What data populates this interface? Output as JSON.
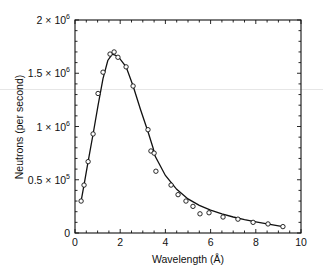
{
  "chart_data": {
    "type": "scatter",
    "title": "",
    "xlabel": "Wavelength (Å)",
    "ylabel": "Neutrons (per second)",
    "xlim": [
      0,
      10
    ],
    "ylim": [
      0,
      2000000
    ],
    "grid": false,
    "legend": null,
    "x_ticks": [
      0,
      2,
      4,
      6,
      8,
      10
    ],
    "x_tick_labels": [
      "0",
      "2",
      "4",
      "6",
      "8",
      "10"
    ],
    "y_ticks": [
      0,
      500000,
      1000000,
      1500000,
      2000000
    ],
    "y_tick_labels": [
      {
        "base": "0",
        "exp": ""
      },
      {
        "base": "0.5 × 10",
        "exp": "5"
      },
      {
        "base": "1 × 10",
        "exp": "6"
      },
      {
        "base": "1.5 × 10",
        "exp": "6"
      },
      {
        "base": "2 × 10",
        "exp": "6"
      }
    ],
    "series": [
      {
        "name": "measured",
        "marker": "open-circle",
        "line": false,
        "x": [
          0.27,
          0.4,
          0.58,
          0.8,
          1.02,
          1.24,
          1.55,
          1.73,
          1.9,
          2.26,
          2.57,
          3.23,
          3.36,
          3.5,
          3.58,
          4.25,
          4.56,
          4.91,
          5.22,
          5.53,
          5.93,
          6.55,
          7.21,
          7.88,
          8.54,
          9.2
        ],
        "y": [
          300000,
          450000,
          670000,
          930000,
          1310000,
          1510000,
          1680000,
          1700000,
          1650000,
          1560000,
          1380000,
          970000,
          770000,
          750000,
          580000,
          450000,
          360000,
          300000,
          250000,
          180000,
          190000,
          150000,
          130000,
          100000,
          85000,
          60000
        ]
      },
      {
        "name": "fit",
        "marker": "none",
        "line": true,
        "x": [
          0.27,
          0.4,
          0.58,
          0.8,
          1.02,
          1.24,
          1.45,
          1.65,
          1.9,
          2.26,
          2.57,
          2.9,
          3.23,
          3.45,
          3.55,
          4.0,
          4.5,
          5.0,
          5.5,
          6.0,
          6.5,
          7.0,
          7.5,
          8.0,
          8.5,
          9.2
        ],
        "y": [
          300000,
          450000,
          670000,
          930000,
          1200000,
          1450000,
          1620000,
          1680000,
          1660000,
          1560000,
          1380000,
          1160000,
          950000,
          800000,
          720000,
          540000,
          410000,
          320000,
          260000,
          215000,
          180000,
          150000,
          125000,
          105000,
          85000,
          60000
        ]
      }
    ]
  }
}
